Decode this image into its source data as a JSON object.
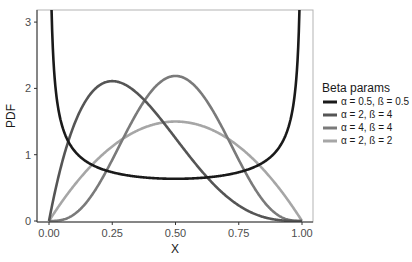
{
  "chart_data": {
    "type": "line",
    "title": "",
    "xlabel": "X",
    "ylabel": "PDF",
    "xlim": [
      0,
      1
    ],
    "ylim": [
      0,
      3.2
    ],
    "x_ticks": [
      "0.00",
      "0.25",
      "0.50",
      "0.75",
      "1.00"
    ],
    "y_ticks": [
      "0",
      "1",
      "2",
      "3"
    ],
    "grid": false,
    "legend": {
      "title": "Beta params",
      "position": "right"
    },
    "series": [
      {
        "name": "α = 0.5, ß = 0.5",
        "alpha": 0.5,
        "beta": 0.5,
        "color": "#1a1a1a",
        "description": "U-shaped, min ~0.64 at x=0.5, diverges at 0 and 1"
      },
      {
        "name": "α = 2, ß = 4",
        "alpha": 2,
        "beta": 4,
        "color": "#555555",
        "description": "peak ~2.11 at x=0.25"
      },
      {
        "name": "α = 4, ß = 4",
        "alpha": 4,
        "beta": 4,
        "color": "#7a7a7a",
        "description": "peak ~2.19 at x=0.5"
      },
      {
        "name": "α = 2, ß = 2",
        "alpha": 2,
        "beta": 2,
        "color": "#a6a6a6",
        "description": "peak 1.5 at x=0.5"
      }
    ]
  }
}
